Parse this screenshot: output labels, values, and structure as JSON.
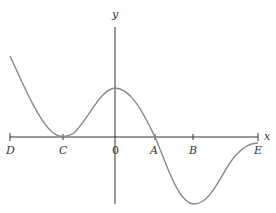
{
  "diagram": {
    "type": "function-graph",
    "axes": {
      "x_label": "x",
      "y_label": "y",
      "colors": {
        "axis": "#333333",
        "curve": "#888888"
      }
    },
    "x_points": [
      {
        "label": "D",
        "px": 10
      },
      {
        "label": "C",
        "px": 63
      },
      {
        "label": "0",
        "px": 115
      },
      {
        "label": "A",
        "px": 155
      },
      {
        "label": "B",
        "px": 193
      },
      {
        "label": "E",
        "px": 258
      }
    ],
    "curve_description": "Starts high at D, decreases to touch the x-axis at C (local min), rises to a local max on the y-axis, crosses the x-axis at A, reaches a minimum near B below the axis, then rises toward E ending slightly below the axis."
  }
}
